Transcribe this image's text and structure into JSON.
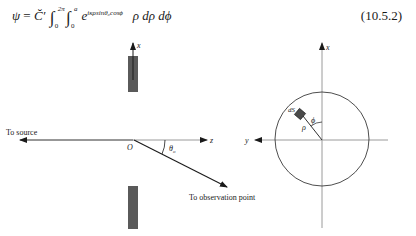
{
  "equation": {
    "lhs": "ψ",
    "equals": "=",
    "constant": "C̆′",
    "outer_integral": {
      "lower": "0",
      "upper": "2π"
    },
    "inner_integral": {
      "lower": "0",
      "upper": "a"
    },
    "exponent_base": "e",
    "exponent": "iκρsinθ₀cosϕ",
    "integrand_tail": "ρ dρ dϕ",
    "number": "(10.5.2)"
  },
  "left_figure": {
    "axis_x_label": "x",
    "axis_z_label": "z",
    "origin_label": "O",
    "angle_label": "θ",
    "angle_subscript": "o",
    "source_label": "To source",
    "observation_label": "To observation point"
  },
  "right_figure": {
    "axis_x_label": "x",
    "axis_y_label": "y",
    "element_label": "dS",
    "radius_label": "ρ",
    "angle_label": "ϕ"
  },
  "colors": {
    "ink": "#1a1a1a",
    "axis": "#9a9a9a",
    "aperture_screen": "#5a5a5a"
  }
}
